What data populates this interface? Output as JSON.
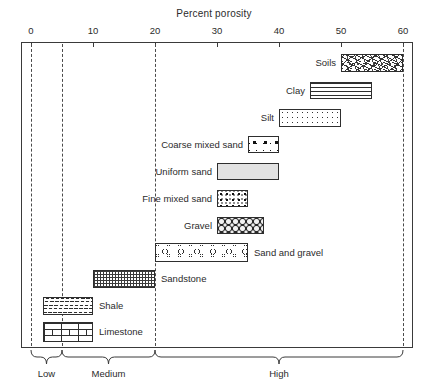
{
  "chart": {
    "title": "Percent porosity",
    "axis": {
      "label": "Percent porosity",
      "ticks": [
        0,
        10,
        20,
        30,
        40,
        50,
        60
      ],
      "tick_labels": [
        "0",
        "10",
        "20",
        "30",
        "40",
        "50",
        "60"
      ],
      "min": 0,
      "max": 60,
      "gridlines_dashed_at": [
        0,
        5,
        20,
        60
      ]
    },
    "categories_brace": [
      {
        "label": "Low",
        "from": 0,
        "to": 5
      },
      {
        "label": "Medium",
        "from": 5,
        "to": 20
      },
      {
        "label": "High",
        "from": 20,
        "to": 60
      }
    ]
  },
  "chart_data": {
    "type": "bar",
    "orientation": "horizontal-range",
    "title": "Percent porosity",
    "xlabel": "Percent porosity",
    "ylabel": "",
    "xlim": [
      0,
      60
    ],
    "grid": "dashed vertical at 0, 5, 20, 60",
    "legend": "none (labels adjacent to bars)",
    "categories": [
      "Soils",
      "Clay",
      "Silt",
      "Coarse mixed sand",
      "Uniform sand",
      "Fine mixed sand",
      "Gravel",
      "Sand and gravel",
      "Sandstone",
      "Shale",
      "Limestone"
    ],
    "ranges": [
      {
        "name": "Soils",
        "from": 50,
        "to": 60,
        "pattern": "scattered-dashes",
        "label_side": "left"
      },
      {
        "name": "Clay",
        "from": 45,
        "to": 55,
        "pattern": "horizontal-dashes",
        "label_side": "left"
      },
      {
        "name": "Silt",
        "from": 40,
        "to": 50,
        "pattern": "fine-dots",
        "label_side": "left"
      },
      {
        "name": "Coarse mixed sand",
        "from": 35,
        "to": 40,
        "pattern": "coarse-grains",
        "label_side": "left"
      },
      {
        "name": "Uniform sand",
        "from": 30,
        "to": 40,
        "pattern": "solid-light-grey",
        "label_side": "left"
      },
      {
        "name": "Fine mixed sand",
        "from": 30,
        "to": 35,
        "pattern": "fine-grains",
        "label_side": "left"
      },
      {
        "name": "Gravel",
        "from": 30,
        "to": 37.5,
        "pattern": "packed-pebbles",
        "label_side": "left"
      },
      {
        "name": "Sand and gravel",
        "from": 20,
        "to": 35,
        "pattern": "pebbles-in-sand",
        "label_side": "right"
      },
      {
        "name": "Sandstone",
        "from": 10,
        "to": 20,
        "pattern": "cross-hatch",
        "label_side": "right"
      },
      {
        "name": "Shale",
        "from": 2,
        "to": 10,
        "pattern": "wavy-lines",
        "label_side": "right"
      },
      {
        "name": "Limestone",
        "from": 2,
        "to": 10,
        "pattern": "brick",
        "label_side": "right"
      }
    ],
    "porosity_class_brackets": [
      {
        "label": "Low",
        "from": 0,
        "to": 5
      },
      {
        "label": "Medium",
        "from": 5,
        "to": 20
      },
      {
        "label": "High",
        "from": 20,
        "to": 60
      }
    ]
  }
}
